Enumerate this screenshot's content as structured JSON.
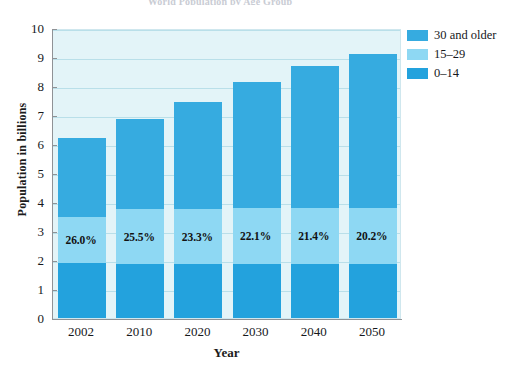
{
  "chart_data": {
    "type": "bar",
    "stacked": true,
    "title": "World Population by Age Group",
    "xlabel": "Year",
    "ylabel": "Population in billions",
    "categories": [
      "2002",
      "2010",
      "2020",
      "2030",
      "2040",
      "2050"
    ],
    "ylim": [
      0,
      10
    ],
    "yticks": [
      0,
      1,
      2,
      3,
      4,
      5,
      6,
      7,
      8,
      9,
      10
    ],
    "grid": true,
    "legend_position": "top-right",
    "series": [
      {
        "name": "0–14",
        "color": "#23a2dd",
        "values": [
          1.9,
          1.85,
          1.85,
          1.85,
          1.85,
          1.85
        ]
      },
      {
        "name": "15–29",
        "color": "#8ed8f3",
        "values": [
          1.6,
          1.9,
          1.9,
          1.95,
          1.95,
          1.95
        ]
      },
      {
        "name": "30 and older",
        "color": "#36abe0",
        "values": [
          2.7,
          3.1,
          3.7,
          4.35,
          4.9,
          5.3
        ]
      }
    ],
    "totals": [
      6.2,
      6.85,
      7.45,
      8.15,
      8.7,
      9.1
    ],
    "segment_tops": {
      "young": [
        1.9,
        1.85,
        1.85,
        1.85,
        1.85,
        1.85
      ],
      "mid": [
        3.5,
        3.75,
        3.75,
        3.8,
        3.8,
        3.8
      ]
    },
    "annotations": [
      {
        "category": "2002",
        "text": "26.0%"
      },
      {
        "category": "2010",
        "text": "25.5%"
      },
      {
        "category": "2020",
        "text": "23.3%"
      },
      {
        "category": "2030",
        "text": "22.1%"
      },
      {
        "category": "2040",
        "text": "21.4%"
      },
      {
        "category": "2050",
        "text": "20.2%"
      }
    ]
  },
  "legend": {
    "items": [
      {
        "label": "30 and older",
        "color": "#36abe0"
      },
      {
        "label": "15–29",
        "color": "#8ed8f3"
      },
      {
        "label": "0–14",
        "color": "#23a2dd"
      }
    ]
  },
  "colors": {
    "plot_background": "#e3f4f8",
    "gridline": "#b9dfe9",
    "axis": "#8f9296",
    "old": "#36abe0",
    "mid": "#8ed8f3",
    "young": "#23a2dd",
    "text": "#16181c"
  }
}
